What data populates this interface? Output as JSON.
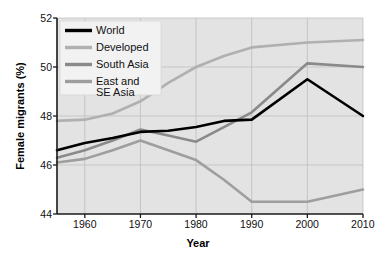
{
  "chart_data": {
    "type": "line",
    "title": "",
    "xlabel": "Year",
    "ylabel": "Female migrants (%)",
    "xlim": [
      1955,
      2010
    ],
    "ylim": [
      44,
      52
    ],
    "xticks": [
      1960,
      1970,
      1980,
      1990,
      2000,
      2010
    ],
    "yticks": [
      44,
      46,
      48,
      50,
      52
    ],
    "grid": true,
    "legend_position": "top-left",
    "plot_background": "#e3e3e3",
    "series": [
      {
        "name": "World",
        "color": "#000000",
        "width": 2.6,
        "x": [
          1955,
          1960,
          1965,
          1970,
          1975,
          1980,
          1985,
          1990,
          2000,
          2010
        ],
        "values": [
          46.6,
          46.9,
          47.1,
          47.35,
          47.4,
          47.55,
          47.8,
          47.85,
          49.5,
          48.0
        ]
      },
      {
        "name": "Developed",
        "color": "#b0b0b0",
        "width": 2.6,
        "x": [
          1955,
          1960,
          1965,
          1970,
          1975,
          1980,
          1985,
          1990,
          2000,
          2010
        ],
        "values": [
          47.8,
          47.85,
          48.1,
          48.6,
          49.35,
          50.0,
          50.45,
          50.8,
          51.0,
          51.1
        ]
      },
      {
        "name": "South Asia",
        "color": "#8a8a8a",
        "width": 2.6,
        "x": [
          1955,
          1960,
          1965,
          1970,
          1975,
          1980,
          1985,
          1990,
          2000,
          2010
        ],
        "values": [
          46.3,
          46.6,
          47.0,
          47.45,
          47.2,
          46.95,
          47.55,
          48.15,
          50.15,
          50.0
        ]
      },
      {
        "name": "East and SE Asia",
        "color": "#9e9e9e",
        "width": 2.6,
        "x": [
          1955,
          1960,
          1965,
          1970,
          1975,
          1980,
          1985,
          1990,
          2000,
          2010
        ],
        "values": [
          46.1,
          46.25,
          46.6,
          47.0,
          46.6,
          46.2,
          45.4,
          44.5,
          44.5,
          45.0
        ]
      }
    ]
  },
  "legend": {
    "entries": [
      {
        "label": "World",
        "color": "#000000"
      },
      {
        "label": "Developed",
        "color": "#b0b0b0"
      },
      {
        "label": "South Asia",
        "color": "#8a8a8a"
      },
      {
        "label": "East and",
        "label2": "SE Asia",
        "color": "#9e9e9e"
      }
    ]
  },
  "axes": {
    "y_title": "Female migrants (%)",
    "x_title": "Year",
    "y_tick_0": "44",
    "y_tick_1": "46",
    "y_tick_2": "48",
    "y_tick_3": "50",
    "y_tick_4": "52",
    "x_tick_0": "1960",
    "x_tick_1": "1970",
    "x_tick_2": "1980",
    "x_tick_3": "1990",
    "x_tick_4": "2000",
    "x_tick_5": "2010"
  }
}
